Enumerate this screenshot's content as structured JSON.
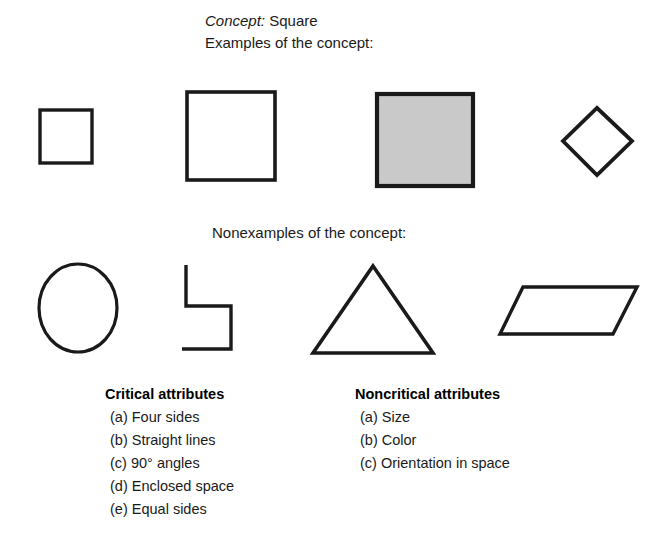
{
  "header": {
    "concept_label": "Concept:",
    "concept_value": " Square",
    "examples_label": "Examples of the concept:",
    "nonexamples_label": "Nonexamples of the concept:"
  },
  "colors": {
    "stroke": "#1a1a1a",
    "gray_fill": "#c9c9c9",
    "background": "#ffffff"
  },
  "examples": [
    {
      "name": "small-square",
      "shape": "square",
      "fill": "none",
      "note": "small plain square"
    },
    {
      "name": "large-square",
      "shape": "square",
      "fill": "none",
      "note": "large plain square"
    },
    {
      "name": "gray-square",
      "shape": "square",
      "fill": "gray",
      "note": "large gray-filled square"
    },
    {
      "name": "rotated-square-diamond",
      "shape": "square",
      "fill": "none",
      "note": "square rotated 45 degrees"
    }
  ],
  "nonexamples": [
    {
      "name": "circle",
      "shape": "circle",
      "fill": "none",
      "note": "circle - not straight lines"
    },
    {
      "name": "open-figure",
      "shape": "open-polyline",
      "fill": "none",
      "note": "open zigzag figure - not enclosed"
    },
    {
      "name": "triangle",
      "shape": "triangle",
      "fill": "none",
      "note": "triangle - three sides"
    },
    {
      "name": "parallelogram",
      "shape": "parallelogram",
      "fill": "none",
      "note": "parallelogram - no 90 degree angles"
    }
  ],
  "attributes": {
    "critical": {
      "title": "Critical attributes",
      "items": [
        {
          "marker": "(a)",
          "text": "Four sides"
        },
        {
          "marker": "(b)",
          "text": "Straight lines"
        },
        {
          "marker": "(c)",
          "text": "90° angles"
        },
        {
          "marker": "(d)",
          "text": "Enclosed space"
        },
        {
          "marker": "(e)",
          "text": "Equal sides"
        }
      ]
    },
    "noncritical": {
      "title": "Noncritical attributes",
      "items": [
        {
          "marker": "(a)",
          "text": "Size"
        },
        {
          "marker": "(b)",
          "text": "Color"
        },
        {
          "marker": "(c)",
          "text": "Orientation in space"
        }
      ]
    }
  }
}
